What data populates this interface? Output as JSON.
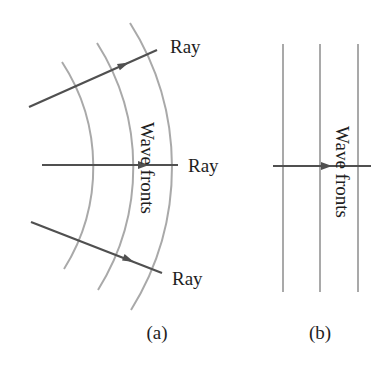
{
  "figure": {
    "panel_a": {
      "caption": "(a)",
      "wavefront_label": "Wave fronts",
      "ray_labels": [
        "Ray",
        "Ray",
        "Ray"
      ],
      "description": "Spherical wave fronts (concentric arcs) with rays radiating outward perpendicular to them"
    },
    "panel_b": {
      "caption": "(b)",
      "wavefront_label": "Wave fronts",
      "description": "Plane wave fronts (parallel straight lines) with a single ray perpendicular to them"
    },
    "colors": {
      "wavefront": "#a9a9a9",
      "ray": "#505050",
      "text": "#1e1e1e",
      "background": "#ffffff"
    }
  }
}
